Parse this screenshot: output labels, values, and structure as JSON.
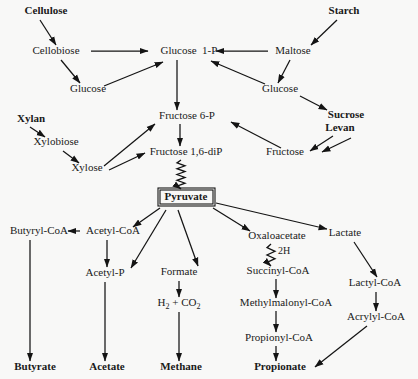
{
  "diagram": {
    "width": 418,
    "height": 379,
    "background_color": "#f8f8f7",
    "ink_color": "#141414",
    "nodes": [
      {
        "id": "cellulose",
        "label": "Cellulose",
        "x": 46,
        "y": 14,
        "bold": true,
        "boxed": false
      },
      {
        "id": "starch",
        "label": "Starch",
        "x": 344,
        "y": 14,
        "bold": true,
        "boxed": false
      },
      {
        "id": "cellobiose",
        "label": "Cellobiose",
        "x": 56,
        "y": 54,
        "bold": false,
        "boxed": false
      },
      {
        "id": "glucose-1-p",
        "label": "Glucose  1-P",
        "x": 189,
        "y": 54,
        "bold": false,
        "boxed": false
      },
      {
        "id": "maltose",
        "label": "Maltose",
        "x": 293,
        "y": 54,
        "bold": false,
        "boxed": false
      },
      {
        "id": "glucose-left",
        "label": "Glucose",
        "x": 88,
        "y": 92,
        "bold": false,
        "boxed": false
      },
      {
        "id": "glucose-right",
        "label": "Glucose",
        "x": 280,
        "y": 92,
        "bold": false,
        "boxed": false
      },
      {
        "id": "xylan",
        "label": "Xylan",
        "x": 31,
        "y": 122,
        "bold": true,
        "boxed": false
      },
      {
        "id": "fructose-6-p",
        "label": "Fructose 6-P",
        "x": 187,
        "y": 119,
        "bold": false,
        "boxed": false
      },
      {
        "id": "sucrose",
        "label": "Sucrose",
        "x": 346,
        "y": 118,
        "bold": true,
        "boxed": false
      },
      {
        "id": "levan",
        "label": "Levan",
        "x": 340,
        "y": 131,
        "bold": true,
        "boxed": false
      },
      {
        "id": "xylobiose",
        "label": "Xylobiose",
        "x": 56,
        "y": 145,
        "bold": false,
        "boxed": false
      },
      {
        "id": "fructose-16-dip",
        "label": "Fructose 1,6-diP",
        "x": 186,
        "y": 155,
        "bold": false,
        "boxed": false
      },
      {
        "id": "fructose",
        "label": "Fructose",
        "x": 285,
        "y": 155,
        "bold": false,
        "boxed": false
      },
      {
        "id": "xylose",
        "label": "Xylose",
        "x": 87,
        "y": 171,
        "bold": false,
        "boxed": false
      },
      {
        "id": "pyruvate",
        "label": "Pyruvate",
        "x": 186,
        "y": 200,
        "bold": true,
        "boxed": true
      },
      {
        "id": "butyryl-coa",
        "label": "Butyryl-CoA",
        "x": 39,
        "y": 234,
        "bold": false,
        "boxed": false
      },
      {
        "id": "acetyl-coa",
        "label": "Acetyl-CoA",
        "x": 113,
        "y": 234,
        "bold": false,
        "boxed": false
      },
      {
        "id": "oxaloacetate",
        "label": "Oxaloacetate",
        "x": 277,
        "y": 239,
        "bold": false,
        "boxed": false
      },
      {
        "id": "lactate",
        "label": "Lactate",
        "x": 345,
        "y": 236,
        "bold": false,
        "boxed": false
      },
      {
        "id": "acetyl-p",
        "label": "Acetyl-P",
        "x": 105,
        "y": 276,
        "bold": false,
        "boxed": false
      },
      {
        "id": "formate",
        "label": "Formate",
        "x": 179,
        "y": 275,
        "bold": false,
        "boxed": false
      },
      {
        "id": "succinyl-coa",
        "label": "Succinyl-CoA",
        "x": 278,
        "y": 274,
        "bold": false,
        "boxed": false
      },
      {
        "id": "lactyl-coa",
        "label": "Lactyl-CoA",
        "x": 375,
        "y": 286,
        "bold": false,
        "boxed": false
      },
      {
        "id": "h2-co2",
        "label": "H2 + CO2",
        "x": 179,
        "y": 306,
        "bold": false,
        "boxed": false,
        "subscripts": true
      },
      {
        "id": "methylmalonyl-coa",
        "label": "Methylmalonyl-CoA",
        "x": 286,
        "y": 306,
        "bold": false,
        "boxed": false
      },
      {
        "id": "acrylyl-coa",
        "label": "Acrylyl-CoA",
        "x": 376,
        "y": 320,
        "bold": false,
        "boxed": false
      },
      {
        "id": "propionyl-coa",
        "label": "Propionyl-CoA",
        "x": 279,
        "y": 341,
        "bold": false,
        "boxed": false
      },
      {
        "id": "butyrate",
        "label": "Butyrate",
        "x": 35,
        "y": 370,
        "bold": true,
        "boxed": false
      },
      {
        "id": "acetate",
        "label": "Acetate",
        "x": 107,
        "y": 370,
        "bold": true,
        "boxed": false
      },
      {
        "id": "methane",
        "label": "Methane",
        "x": 181,
        "y": 370,
        "bold": true,
        "boxed": false
      },
      {
        "id": "propionate",
        "label": "Propionate",
        "x": 280,
        "y": 370,
        "bold": true,
        "boxed": false
      }
    ],
    "edges": [
      {
        "id": "cellulose-cellobiose",
        "from": "cellulose",
        "to": "cellobiose",
        "kind": "arrow",
        "x1": 40,
        "y1": 20,
        "x2": 56,
        "y2": 45
      },
      {
        "id": "starch-maltose",
        "from": "starch",
        "to": "maltose",
        "kind": "arrow",
        "x1": 337,
        "y1": 20,
        "x2": 311,
        "y2": 45
      },
      {
        "id": "cellobiose-glucose1p",
        "from": "cellobiose",
        "to": "glucose-1-p",
        "kind": "arrow",
        "x1": 91,
        "y1": 51,
        "x2": 148,
        "y2": 51
      },
      {
        "id": "cellobiose-glucose",
        "from": "cellobiose",
        "to": "glucose-left",
        "kind": "arrow",
        "x1": 61,
        "y1": 60,
        "x2": 80,
        "y2": 83
      },
      {
        "id": "maltose-glucose1p",
        "from": "maltose",
        "to": "glucose-1-p",
        "kind": "arrow",
        "x1": 268,
        "y1": 51,
        "x2": 216,
        "y2": 51
      },
      {
        "id": "maltose-glucose",
        "from": "maltose",
        "to": "glucose-right",
        "kind": "arrow",
        "x1": 290,
        "y1": 60,
        "x2": 278,
        "y2": 83
      },
      {
        "id": "glucoseL-glucose1p",
        "from": "glucose-left",
        "to": "glucose-1-p",
        "kind": "arrow",
        "x1": 104,
        "y1": 86,
        "x2": 163,
        "y2": 62
      },
      {
        "id": "glucoseR-glucose1p",
        "from": "glucose-right",
        "to": "glucose-1-p",
        "kind": "arrow",
        "x1": 265,
        "y1": 84,
        "x2": 211,
        "y2": 61
      },
      {
        "id": "glucose1p-fructose6p",
        "from": "glucose-1-p",
        "to": "fructose-6-p",
        "kind": "arrow",
        "x1": 177,
        "y1": 60,
        "x2": 177,
        "y2": 110
      },
      {
        "id": "glucoseR-sucrose",
        "from": "glucose-right",
        "to": "sucrose",
        "kind": "arrow",
        "x1": 300,
        "y1": 96,
        "x2": 327,
        "y2": 110
      },
      {
        "id": "xylan-xylobiose",
        "from": "xylan",
        "to": "xylobiose",
        "kind": "arrow",
        "x1": 30,
        "y1": 127,
        "x2": 45,
        "y2": 137
      },
      {
        "id": "xylobiose-xylose",
        "from": "xylobiose",
        "to": "xylose",
        "kind": "arrow",
        "x1": 63,
        "y1": 151,
        "x2": 79,
        "y2": 163
      },
      {
        "id": "xylose-fructose6p",
        "from": "xylose",
        "to": "fructose-6-p",
        "kind": "arrow",
        "x1": 104,
        "y1": 166,
        "x2": 155,
        "y2": 124
      },
      {
        "id": "xylose-fructose16dip",
        "from": "xylose",
        "to": "fructose-16-dip",
        "kind": "arrow",
        "x1": 109,
        "y1": 170,
        "x2": 145,
        "y2": 153
      },
      {
        "id": "fructose6p-16dip",
        "from": "fructose-6-p",
        "to": "fructose-16-dip",
        "kind": "arrow",
        "x1": 180,
        "y1": 124,
        "x2": 180,
        "y2": 146
      },
      {
        "id": "sucrose-fructose",
        "from": "sucrose",
        "to": "fructose",
        "kind": "arrow",
        "x1": 333,
        "y1": 136,
        "x2": 310,
        "y2": 151
      },
      {
        "id": "levan-fructose",
        "from": "levan",
        "to": "fructose",
        "kind": "arrow",
        "x1": 351,
        "y1": 138,
        "x2": 322,
        "y2": 152
      },
      {
        "id": "fructose-fructose6p",
        "from": "fructose",
        "to": "fructose-6-p",
        "kind": "arrow",
        "x1": 281,
        "y1": 148,
        "x2": 231,
        "y2": 122
      },
      {
        "id": "fructose16dip-pyruvate",
        "from": "fructose-16-dip",
        "to": "pyruvate",
        "kind": "zigzag",
        "x1": 181,
        "y1": 160,
        "x2": 181,
        "y2": 189,
        "amplitude": 4,
        "periods": 5
      },
      {
        "id": "pyruvate-acetylcoa",
        "from": "pyruvate",
        "to": "acetyl-coa",
        "kind": "arrow",
        "x1": 160,
        "y1": 208,
        "x2": 133,
        "y2": 227
      },
      {
        "id": "pyruvate-acetylp",
        "from": "pyruvate",
        "to": "acetyl-p",
        "kind": "arrow",
        "x1": 166,
        "y1": 210,
        "x2": 131,
        "y2": 268
      },
      {
        "id": "pyruvate-formate",
        "from": "pyruvate",
        "to": "formate",
        "kind": "arrow",
        "x1": 178,
        "y1": 210,
        "x2": 198,
        "y2": 266
      },
      {
        "id": "pyruvate-oxaloacetate",
        "from": "pyruvate",
        "to": "oxaloacetate",
        "kind": "arrow",
        "x1": 213,
        "y1": 208,
        "x2": 250,
        "y2": 231
      },
      {
        "id": "pyruvate-lactate",
        "from": "pyruvate",
        "to": "lactate",
        "kind": "arrow",
        "x1": 216,
        "y1": 203,
        "x2": 327,
        "y2": 229
      },
      {
        "id": "acetylcoa-butyrylcoa",
        "from": "acetyl-coa",
        "to": "butyryl-coa",
        "kind": "arrow",
        "x1": 80,
        "y1": 231,
        "x2": 68,
        "y2": 231
      },
      {
        "id": "acetylcoa-acetylp",
        "from": "acetyl-coa",
        "to": "acetyl-p",
        "kind": "arrow",
        "x1": 107,
        "y1": 240,
        "x2": 107,
        "y2": 267
      },
      {
        "id": "butyrylcoa-butyrate",
        "from": "butyryl-coa",
        "to": "butyrate",
        "kind": "arrow",
        "x1": 30,
        "y1": 240,
        "x2": 30,
        "y2": 361
      },
      {
        "id": "acetylp-acetate",
        "from": "acetyl-p",
        "to": "acetate",
        "kind": "arrow",
        "x1": 105,
        "y1": 282,
        "x2": 105,
        "y2": 361
      },
      {
        "id": "formate-h2co2",
        "from": "formate",
        "to": "h2-co2",
        "kind": "arrow",
        "x1": 179,
        "y1": 281,
        "x2": 179,
        "y2": 297
      },
      {
        "id": "h2co2-methane",
        "from": "h2-co2",
        "to": "methane",
        "kind": "arrow",
        "x1": 179,
        "y1": 312,
        "x2": 179,
        "y2": 361
      },
      {
        "id": "oxaloacetate-succinyl",
        "from": "oxaloacetate",
        "to": "succinyl-coa",
        "kind": "zigzag",
        "x1": 271,
        "y1": 244,
        "x2": 271,
        "y2": 266,
        "amplitude": 4,
        "periods": 3,
        "label": "2H",
        "label_x": 278,
        "label_y": 254
      },
      {
        "id": "succinyl-methylmalonyl",
        "from": "succinyl-coa",
        "to": "methylmalonyl-coa",
        "kind": "arrow",
        "x1": 276,
        "y1": 279,
        "x2": 276,
        "y2": 298
      },
      {
        "id": "methylmalonyl-propionyl",
        "from": "methylmalonyl-coa",
        "to": "propionyl-coa",
        "kind": "arrow",
        "x1": 276,
        "y1": 311,
        "x2": 276,
        "y2": 332
      },
      {
        "id": "propionyl-propionate",
        "from": "propionyl-coa",
        "to": "propionate",
        "kind": "arrow",
        "x1": 276,
        "y1": 346,
        "x2": 276,
        "y2": 361
      },
      {
        "id": "lactate-lactylcoa",
        "from": "lactate",
        "to": "lactyl-coa",
        "kind": "arrow",
        "x1": 354,
        "y1": 242,
        "x2": 377,
        "y2": 277
      },
      {
        "id": "lactylcoa-acrylylcoa",
        "from": "lactyl-coa",
        "to": "acrylyl-coa",
        "kind": "arrow",
        "x1": 376,
        "y1": 292,
        "x2": 376,
        "y2": 311
      },
      {
        "id": "acrylylcoa-propionate",
        "from": "acrylyl-coa",
        "to": "propionate",
        "kind": "arrow",
        "x1": 367,
        "y1": 326,
        "x2": 315,
        "y2": 367
      }
    ],
    "boxes": [
      {
        "id": "pyruvate-box",
        "node": "pyruvate",
        "x": 158,
        "y": 188,
        "width": 57,
        "height": 18
      }
    ]
  }
}
